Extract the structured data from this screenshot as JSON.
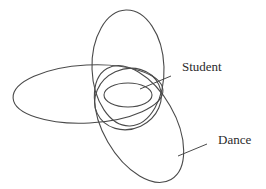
{
  "diagram": {
    "type": "overlapping-ellipses",
    "stroke_color": "#4a4a4a",
    "label_color": "#2b2b2b",
    "background": "#ffffff",
    "labels": {
      "student": "Student",
      "dance": "Dance"
    }
  }
}
